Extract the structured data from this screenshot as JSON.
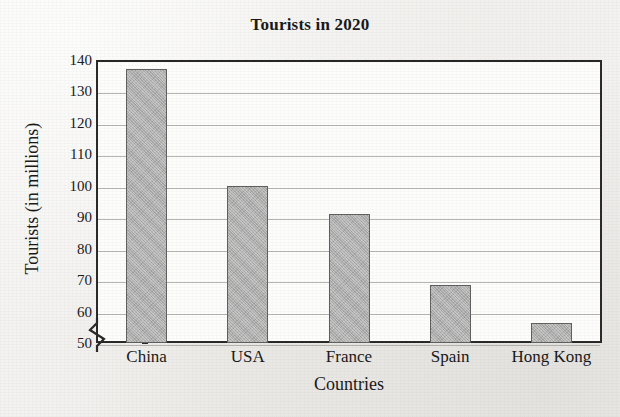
{
  "chart_data": {
    "type": "bar",
    "title": "Tourists in 2020",
    "xlabel": "Countries",
    "ylabel": "Tourists (in millions)",
    "categories": [
      "China",
      "USA",
      "France",
      "Spain",
      "Hong Kong"
    ],
    "values": [
      137,
      100,
      91,
      68.5,
      56.5
    ],
    "ylim": [
      50,
      140
    ],
    "yticks": [
      50,
      60,
      70,
      80,
      90,
      100,
      110,
      120,
      130,
      140
    ],
    "ytick_labels": [
      "50",
      "60",
      "70",
      "80",
      "90",
      "100",
      "110",
      "120",
      "130",
      "140"
    ],
    "grid": true,
    "axis_break": true,
    "axis_break_symbol": "zigzag-below-50",
    "legend": false,
    "bar_color": "#adadad",
    "bar_edge_color": "#5e5e5e",
    "plot_background": "#fdfdfc",
    "page_background": "#f2f1ef",
    "text_color": "#161616",
    "gridline_color": "#a9a7a3"
  }
}
